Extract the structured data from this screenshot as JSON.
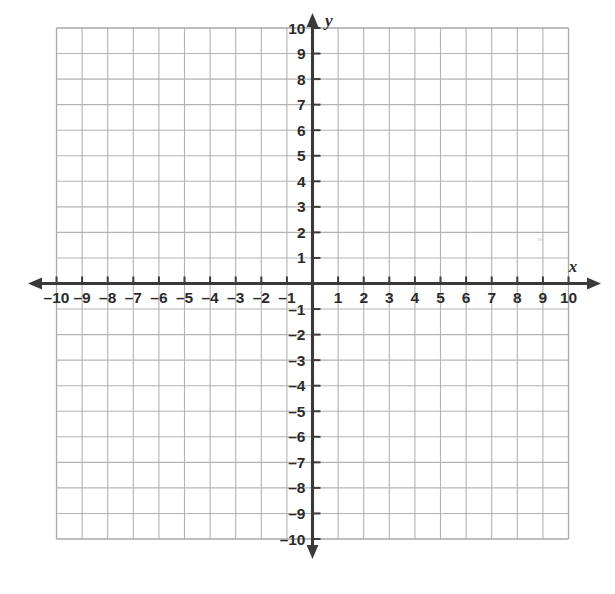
{
  "figure": {
    "kind": "cartesian-coordinate-plane",
    "background_color": "#ffffff",
    "grid_color": "#b3b3b3",
    "axis_color": "#3a3a3a",
    "label_color": "#2b2b2b"
  },
  "axes": {
    "x_name": "x",
    "y_name": "y",
    "minus_sign": "–"
  },
  "chart_data": {
    "type": "scatter",
    "title": "",
    "subtitle": "",
    "xlabel": "x",
    "ylabel": "y",
    "xlim": [
      -10,
      10
    ],
    "ylim": [
      -10,
      10
    ],
    "x_tick_step": 1,
    "y_tick_step": 1,
    "grid": true,
    "legend": null,
    "series": [],
    "x": [],
    "y": [],
    "annotations": [],
    "x_tick_labels": [
      "–10",
      "–9",
      "–8",
      "–7",
      "–6",
      "–5",
      "–4",
      "–3",
      "–2",
      "–1",
      "1",
      "2",
      "3",
      "4",
      "5",
      "6",
      "7",
      "8",
      "9",
      "10"
    ],
    "y_tick_labels": [
      "10",
      "9",
      "8",
      "7",
      "6",
      "5",
      "4",
      "3",
      "2",
      "1",
      "–1",
      "–2",
      "–3",
      "–4",
      "–5",
      "–6",
      "–7",
      "–8",
      "–9",
      "–10"
    ],
    "x_tick_values": [
      -10,
      -9,
      -8,
      -7,
      -6,
      -5,
      -4,
      -3,
      -2,
      -1,
      1,
      2,
      3,
      4,
      5,
      6,
      7,
      8,
      9,
      10
    ],
    "y_tick_values": [
      10,
      9,
      8,
      7,
      6,
      5,
      4,
      3,
      2,
      1,
      -1,
      -2,
      -3,
      -4,
      -5,
      -6,
      -7,
      -8,
      -9,
      -10
    ]
  }
}
